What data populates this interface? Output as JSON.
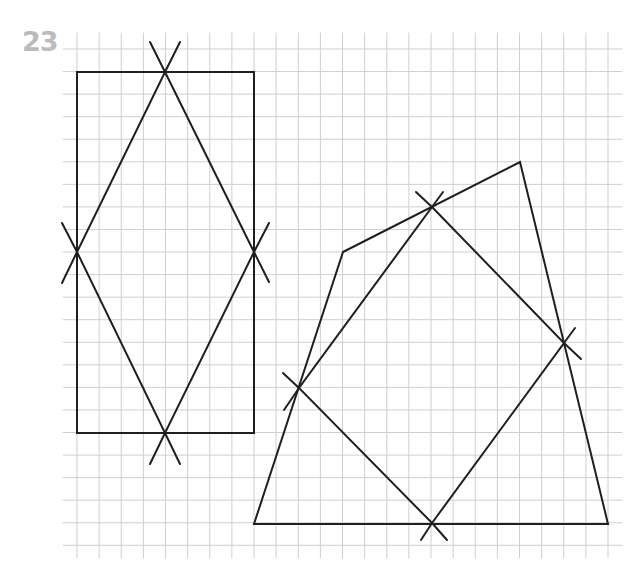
{
  "exercise_number": "23",
  "colors": {
    "grid": "#cfcfcf",
    "stroke": "#1f1f1f",
    "label": "#bcbcbc",
    "background": "#ffffff"
  },
  "grid": {
    "x_start": 77,
    "x_step": 22.125,
    "x_count": 25,
    "v_top": 33,
    "v_bottom": 558,
    "y_start": 49,
    "y_step": 22.56,
    "y_count": 23,
    "h_left": 63,
    "h_right": 622
  },
  "figures": [
    {
      "name": "rectangle",
      "type": "polygon",
      "points": [
        [
          77,
          72
        ],
        [
          254,
          72
        ],
        [
          254,
          433
        ],
        [
          77,
          433
        ]
      ]
    },
    {
      "name": "rhombus-in-rectangle",
      "type": "polygon",
      "points": [
        [
          165,
          72
        ],
        [
          254,
          252
        ],
        [
          165,
          433
        ],
        [
          77,
          252
        ]
      ]
    },
    {
      "name": "quadrilateral",
      "type": "polygon",
      "points": [
        [
          343,
          252
        ],
        [
          520,
          162
        ],
        [
          608,
          524
        ],
        [
          254,
          524
        ]
      ]
    },
    {
      "name": "midpoint-parallelogram",
      "type": "polygon",
      "points": [
        [
          432,
          207
        ],
        [
          564,
          343
        ],
        [
          432,
          523
        ],
        [
          299,
          388
        ]
      ]
    }
  ],
  "cross_marks": [
    {
      "name": "rect-top-mark",
      "lines": [
        [
          [
            150,
            42
          ],
          [
            165,
            72
          ]
        ],
        [
          [
            180,
            42
          ],
          [
            165,
            72
          ]
        ]
      ]
    },
    {
      "name": "rect-left-mark",
      "lines": [
        [
          [
            62,
            223
          ],
          [
            77,
            252
          ]
        ],
        [
          [
            62,
            283
          ],
          [
            77,
            252
          ]
        ]
      ]
    },
    {
      "name": "rect-right-mark",
      "lines": [
        [
          [
            269,
            223
          ],
          [
            254,
            252
          ]
        ],
        [
          [
            269,
            282
          ],
          [
            254,
            252
          ]
        ]
      ]
    },
    {
      "name": "rect-bottom-mark",
      "lines": [
        [
          [
            150,
            464
          ],
          [
            165,
            433
          ]
        ],
        [
          [
            180,
            464
          ],
          [
            165,
            433
          ]
        ]
      ]
    },
    {
      "name": "quad-top-mark",
      "lines": [
        [
          [
            416,
            192
          ],
          [
            432,
            207
          ]
        ],
        [
          [
            443,
            192
          ],
          [
            432,
            207
          ]
        ]
      ]
    },
    {
      "name": "quad-right-mark",
      "lines": [
        [
          [
            575,
            328
          ],
          [
            564,
            343
          ]
        ],
        [
          [
            581,
            359
          ],
          [
            564,
            343
          ]
        ]
      ]
    },
    {
      "name": "quad-left-mark",
      "lines": [
        [
          [
            283,
            373
          ],
          [
            299,
            388
          ]
        ],
        [
          [
            284,
            410
          ],
          [
            299,
            388
          ]
        ]
      ]
    },
    {
      "name": "quad-bottom-mark",
      "lines": [
        [
          [
            421,
            540
          ],
          [
            432,
            523
          ]
        ],
        [
          [
            447,
            540
          ],
          [
            432,
            523
          ]
        ]
      ]
    }
  ]
}
